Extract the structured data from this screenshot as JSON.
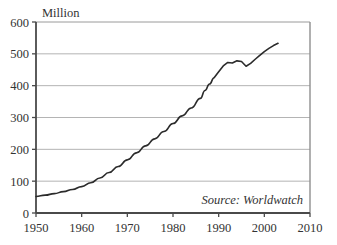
{
  "chart_data": {
    "type": "line",
    "title": "",
    "subtitle": "",
    "xlabel": "",
    "ylabel": "Million",
    "ylim": [
      0,
      600
    ],
    "xlim": [
      1950,
      2010
    ],
    "grid": "horizontal",
    "legend": "none",
    "y_ticks": [
      "0",
      "100",
      "200",
      "300",
      "400",
      "500",
      "600"
    ],
    "y_tick_values": [
      0,
      100,
      200,
      300,
      400,
      500,
      600
    ],
    "x_ticks": [
      "1950",
      "1960",
      "1970",
      "1980",
      "1990",
      "2000",
      "2010"
    ],
    "x_tick_values": [
      1950,
      1960,
      1970,
      1980,
      1990,
      2000,
      2010
    ],
    "annotations": [
      {
        "name": "source-note",
        "text": "Source: Worldwatch",
        "x": 2000,
        "y": 45,
        "style": "italic"
      }
    ],
    "series": [
      {
        "name": "value",
        "color": "#2b2b2b",
        "x": [
          1950,
          1952,
          1954,
          1956,
          1958,
          1960,
          1962,
          1964,
          1966,
          1968,
          1970,
          1972,
          1974,
          1976,
          1978,
          1980,
          1982,
          1984,
          1986,
          1987,
          1988,
          1989,
          1990,
          1991,
          1992,
          1993,
          1994,
          1995,
          1996,
          1997,
          1998,
          1999,
          2000,
          2001,
          2002,
          2003
        ],
        "values": [
          52,
          56,
          61,
          67,
          74,
          83,
          95,
          110,
          127,
          146,
          167,
          189,
          211,
          233,
          256,
          281,
          305,
          330,
          360,
          385,
          405,
          425,
          444,
          462,
          473,
          471,
          478,
          476,
          461,
          470,
          483,
          495,
          507,
          517,
          526,
          533
        ]
      }
    ]
  },
  "axis": {
    "y_title": "Million"
  },
  "colors": {
    "line": "#2b2b2b",
    "grid": "#b4b4b4",
    "frame": "#4a4a4a",
    "text": "#333333",
    "background": "#ffffff"
  }
}
